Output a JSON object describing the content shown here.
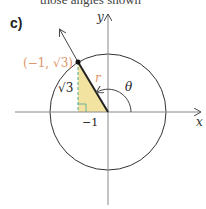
{
  "header": {
    "clipped_text": "those angles shown"
  },
  "part_label": "c)",
  "axes": {
    "x_label": "x",
    "y_label": "y"
  },
  "point": {
    "label": "(−1, √3)",
    "color": "#e0956a"
  },
  "labels": {
    "radius": "r",
    "angle": "θ",
    "opposite": "√3",
    "adjacent": "−1"
  },
  "colors": {
    "triangle_fill": "#f3e3a0",
    "dashed": "#4aa89a",
    "line": "#222222",
    "circle": "#333333"
  }
}
